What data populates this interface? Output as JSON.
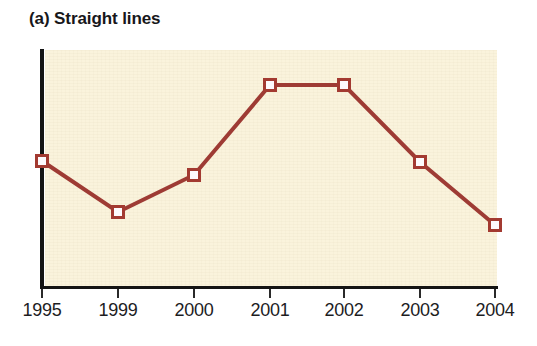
{
  "figure": {
    "title": "(a) Straight lines",
    "panel_label": "(a)"
  },
  "colors": {
    "line": "#9e3b34",
    "marker_border": "#a33a31",
    "marker_fill": "#fdfafd",
    "plot_background": "#faf3dc",
    "axis": "#141414",
    "page_background": "#ffffff",
    "text": "#1d1d1f"
  },
  "axis": {
    "x_tick_labels": [
      "1995",
      "1999",
      "2000",
      "2001",
      "2002",
      "2003",
      "2004"
    ],
    "y_axis_visible": true,
    "y_tick_labels": [],
    "x_label": "",
    "y_label": "",
    "grid": false
  },
  "chart_data": {
    "type": "line",
    "title": "(a) Straight lines",
    "subtitle": "",
    "xlabel": "",
    "ylabel": "",
    "categories": [
      "1995",
      "1999",
      "2000",
      "2001",
      "2002",
      "2003",
      "2004"
    ],
    "x": [
      1995,
      1999,
      2000,
      2001,
      2002,
      2003,
      2004
    ],
    "values": [
      53,
      31,
      47,
      85,
      85,
      52,
      26
    ],
    "series": [
      {
        "name": "Straight lines",
        "values": [
          53,
          31,
          47,
          85,
          85,
          52,
          26
        ],
        "marker": "square",
        "marker_fill": "#fdfafd",
        "marker_border": "#a33a31",
        "line_color": "#9e3b34",
        "line_width": 4
      }
    ],
    "ylim": [
      0,
      100
    ],
    "grid": false,
    "legend": false,
    "legend_position": "none",
    "annotations": []
  },
  "geometry": {
    "plot_left": 45,
    "plot_top": 50,
    "plot_width": 452,
    "plot_height": 238,
    "tick_x": [
      42,
      118,
      194,
      270,
      344,
      420,
      495
    ],
    "point_y": [
      161,
      212,
      175,
      85,
      85,
      162,
      225
    ]
  }
}
